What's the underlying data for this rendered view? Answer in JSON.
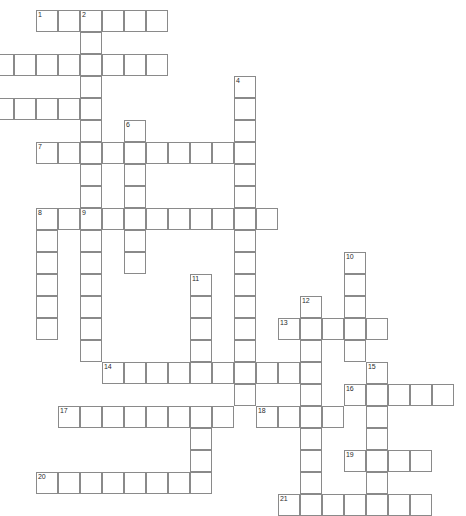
{
  "puzzle": {
    "title": "Crossword Puzzle Grid",
    "cell_size": 22,
    "origin_x": 14,
    "origin_y": 10,
    "grid_columns": 21,
    "grid_rows": 23,
    "border_color": "#8a8a8a",
    "cell_fill": "#ffffff",
    "number_color": "#2b2b2b",
    "background": "#ffffff",
    "entries": [
      {
        "number": "1",
        "direction": "across",
        "col": 1,
        "row": 0,
        "length": 6
      },
      {
        "number": "2",
        "direction": "down",
        "col": 3,
        "row": 0,
        "length": 7
      },
      {
        "number": "3",
        "direction": "across",
        "col": -1,
        "row": 2,
        "length": 8
      },
      {
        "number": "4",
        "direction": "down",
        "col": 10,
        "row": 3,
        "length": 13
      },
      {
        "number": "5",
        "direction": "across",
        "col": -1,
        "row": 4,
        "length": 5
      },
      {
        "number": "6",
        "direction": "down",
        "col": 5,
        "row": 5,
        "length": 7
      },
      {
        "number": "7",
        "direction": "across",
        "col": 1,
        "row": 6,
        "length": 10
      },
      {
        "number": "8",
        "direction": "down",
        "col": 1,
        "row": 9,
        "length": 6
      },
      {
        "number": "9",
        "direction": "down",
        "col": 3,
        "row": 9,
        "length": 7
      },
      {
        "number": "8b",
        "direction": "across",
        "col": 1,
        "row": 9,
        "length": 11
      },
      {
        "number": "10",
        "direction": "down",
        "col": 15,
        "row": 11,
        "length": 6
      },
      {
        "number": "11",
        "direction": "down",
        "col": 8,
        "row": 12,
        "length": 5
      },
      {
        "number": "12",
        "direction": "down",
        "col": 13,
        "row": 13,
        "length": 8
      },
      {
        "number": "13",
        "direction": "across",
        "col": 12,
        "row": 14,
        "length": 5
      },
      {
        "number": "14",
        "direction": "across",
        "col": 4,
        "row": 16,
        "length": 10
      },
      {
        "number": "15",
        "direction": "down",
        "col": 16,
        "row": 16,
        "length": 6
      },
      {
        "number": "16",
        "direction": "across",
        "col": 15,
        "row": 17,
        "length": 5
      },
      {
        "number": "17",
        "direction": "across",
        "col": 2,
        "row": 18,
        "length": 8
      },
      {
        "number": "18",
        "direction": "across",
        "col": 11,
        "row": 18,
        "length": 4
      },
      {
        "number": "19",
        "direction": "across",
        "col": 15,
        "row": 20,
        "length": 4
      },
      {
        "number": "20",
        "direction": "across",
        "col": 1,
        "row": 21,
        "length": 7
      },
      {
        "number": "21",
        "direction": "across",
        "col": 12,
        "row": 22,
        "length": 7
      }
    ],
    "cells": [
      [
        1,
        0
      ],
      [
        2,
        0
      ],
      [
        3,
        0
      ],
      [
        4,
        0
      ],
      [
        5,
        0
      ],
      [
        6,
        0
      ],
      [
        3,
        1
      ],
      [
        -1,
        2
      ],
      [
        0,
        2
      ],
      [
        1,
        2
      ],
      [
        2,
        2
      ],
      [
        3,
        2
      ],
      [
        4,
        2
      ],
      [
        5,
        2
      ],
      [
        6,
        2
      ],
      [
        3,
        3
      ],
      [
        10,
        3
      ],
      [
        -1,
        4
      ],
      [
        0,
        4
      ],
      [
        1,
        4
      ],
      [
        2,
        4
      ],
      [
        3,
        4
      ],
      [
        10,
        4
      ],
      [
        3,
        5
      ],
      [
        5,
        5
      ],
      [
        10,
        5
      ],
      [
        1,
        6
      ],
      [
        2,
        6
      ],
      [
        3,
        6
      ],
      [
        4,
        6
      ],
      [
        5,
        6
      ],
      [
        6,
        6
      ],
      [
        7,
        6
      ],
      [
        8,
        6
      ],
      [
        9,
        6
      ],
      [
        10,
        6
      ],
      [
        3,
        7
      ],
      [
        5,
        7
      ],
      [
        10,
        7
      ],
      [
        3,
        8
      ],
      [
        5,
        8
      ],
      [
        10,
        8
      ],
      [
        1,
        9
      ],
      [
        2,
        9
      ],
      [
        3,
        9
      ],
      [
        4,
        9
      ],
      [
        5,
        9
      ],
      [
        6,
        9
      ],
      [
        7,
        9
      ],
      [
        8,
        9
      ],
      [
        9,
        9
      ],
      [
        10,
        9
      ],
      [
        11,
        9
      ],
      [
        1,
        10
      ],
      [
        3,
        10
      ],
      [
        5,
        10
      ],
      [
        10,
        10
      ],
      [
        1,
        11
      ],
      [
        3,
        11
      ],
      [
        5,
        11
      ],
      [
        10,
        11
      ],
      [
        15,
        11
      ],
      [
        1,
        12
      ],
      [
        3,
        12
      ],
      [
        8,
        12
      ],
      [
        10,
        12
      ],
      [
        15,
        12
      ],
      [
        1,
        13
      ],
      [
        3,
        13
      ],
      [
        8,
        13
      ],
      [
        10,
        13
      ],
      [
        13,
        13
      ],
      [
        15,
        13
      ],
      [
        1,
        14
      ],
      [
        3,
        14
      ],
      [
        8,
        14
      ],
      [
        10,
        14
      ],
      [
        12,
        14
      ],
      [
        13,
        14
      ],
      [
        14,
        14
      ],
      [
        15,
        14
      ],
      [
        16,
        14
      ],
      [
        3,
        15
      ],
      [
        8,
        15
      ],
      [
        10,
        15
      ],
      [
        13,
        15
      ],
      [
        15,
        15
      ],
      [
        4,
        16
      ],
      [
        5,
        16
      ],
      [
        6,
        16
      ],
      [
        7,
        16
      ],
      [
        8,
        16
      ],
      [
        9,
        16
      ],
      [
        10,
        16
      ],
      [
        11,
        16
      ],
      [
        12,
        16
      ],
      [
        13,
        16
      ],
      [
        16,
        16
      ],
      [
        10,
        17
      ],
      [
        13,
        17
      ],
      [
        15,
        17
      ],
      [
        16,
        17
      ],
      [
        17,
        17
      ],
      [
        18,
        17
      ],
      [
        19,
        17
      ],
      [
        2,
        18
      ],
      [
        3,
        18
      ],
      [
        4,
        18
      ],
      [
        5,
        18
      ],
      [
        6,
        18
      ],
      [
        7,
        18
      ],
      [
        8,
        18
      ],
      [
        9,
        18
      ],
      [
        11,
        18
      ],
      [
        12,
        18
      ],
      [
        13,
        18
      ],
      [
        14,
        18
      ],
      [
        16,
        18
      ],
      [
        8,
        19
      ],
      [
        13,
        19
      ],
      [
        16,
        19
      ],
      [
        8,
        20
      ],
      [
        13,
        20
      ],
      [
        15,
        20
      ],
      [
        16,
        20
      ],
      [
        17,
        20
      ],
      [
        18,
        20
      ],
      [
        1,
        21
      ],
      [
        2,
        21
      ],
      [
        3,
        21
      ],
      [
        4,
        21
      ],
      [
        5,
        21
      ],
      [
        6,
        21
      ],
      [
        7,
        21
      ],
      [
        8,
        21
      ],
      [
        13,
        21
      ],
      [
        16,
        21
      ],
      [
        12,
        22
      ],
      [
        13,
        22
      ],
      [
        14,
        22
      ],
      [
        15,
        22
      ],
      [
        16,
        22
      ],
      [
        17,
        22
      ],
      [
        18,
        22
      ]
    ],
    "numbered_cells": [
      {
        "label": "1",
        "col": 1,
        "row": 0
      },
      {
        "label": "2",
        "col": 3,
        "row": 0
      },
      {
        "label": "4",
        "col": 10,
        "row": 3
      },
      {
        "label": "6",
        "col": 5,
        "row": 5
      },
      {
        "label": "7",
        "col": 1,
        "row": 6
      },
      {
        "label": "8",
        "col": 1,
        "row": 9
      },
      {
        "label": "9",
        "col": 3,
        "row": 9
      },
      {
        "label": "10",
        "col": 15,
        "row": 11
      },
      {
        "label": "11",
        "col": 8,
        "row": 12
      },
      {
        "label": "12",
        "col": 13,
        "row": 13
      },
      {
        "label": "13",
        "col": 12,
        "row": 14
      },
      {
        "label": "14",
        "col": 4,
        "row": 16
      },
      {
        "label": "15",
        "col": 16,
        "row": 16
      },
      {
        "label": "16",
        "col": 15,
        "row": 17
      },
      {
        "label": "17",
        "col": 2,
        "row": 18
      },
      {
        "label": "18",
        "col": 11,
        "row": 18
      },
      {
        "label": "19",
        "col": 15,
        "row": 20
      },
      {
        "label": "20",
        "col": 1,
        "row": 21
      },
      {
        "label": "21",
        "col": 12,
        "row": 22
      }
    ]
  }
}
